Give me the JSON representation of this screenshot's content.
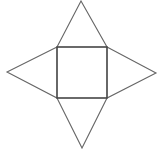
{
  "diagram": {
    "type": "square-pyramid-net",
    "stroke_color": "#555555",
    "background": "#ffffff",
    "square": {
      "x1": 57,
      "y1": 47,
      "x2": 107,
      "y2": 98
    },
    "triangles": [
      {
        "name": "top",
        "points": "57,47 81,1 107,47"
      },
      {
        "name": "right",
        "points": "107,47 156,73 107,98"
      },
      {
        "name": "bottom",
        "points": "57,98 82,148 107,98"
      },
      {
        "name": "left",
        "points": "57,47 7,72 57,98"
      }
    ]
  }
}
